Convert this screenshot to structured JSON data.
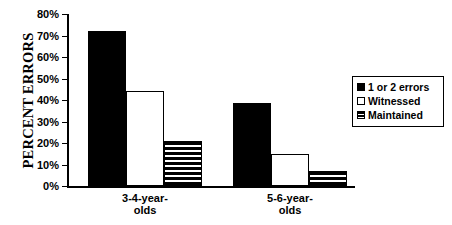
{
  "chart_data": {
    "type": "bar",
    "title": "",
    "xlabel": "",
    "ylabel": "PERCENT ERRORS",
    "ylim": [
      0,
      80
    ],
    "grid": false,
    "legend_position": "right",
    "ytick_labels": [
      "80%",
      "70%",
      "60%",
      "50%",
      "40%",
      "30%",
      "20%",
      "10%",
      "0%"
    ],
    "ytick_values": [
      80,
      70,
      60,
      50,
      40,
      30,
      20,
      10,
      0
    ],
    "categories": [
      "3-4-year-olds",
      "5-6-year-olds"
    ],
    "category_lines": [
      [
        "3-4-year-",
        "olds"
      ],
      [
        "5-6-year-",
        "olds"
      ]
    ],
    "series": [
      {
        "name": "1 or 2 errors",
        "fill": "solid",
        "color": "#000000",
        "values": [
          72,
          38.5
        ]
      },
      {
        "name": "Witnessed",
        "fill": "open",
        "color": "#ffffff",
        "values": [
          44,
          15
        ]
      },
      {
        "name": "Maintained",
        "fill": "striped",
        "color": "#000000",
        "values": [
          21,
          7
        ]
      }
    ]
  }
}
